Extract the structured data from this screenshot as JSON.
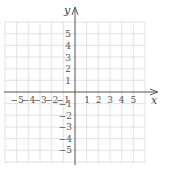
{
  "diagram": {
    "type": "coordinate-plane",
    "x_axis_label": "x",
    "y_axis_label": "y",
    "x_range": [
      -6,
      6
    ],
    "y_range": [
      -6,
      6
    ],
    "x_tick_labels": [
      "−5",
      "−4",
      "−3",
      "−2",
      "−1",
      "1",
      "2",
      "3",
      "4",
      "5"
    ],
    "y_tick_labels": [
      "5",
      "4",
      "3",
      "2",
      "1",
      "−1",
      "−2",
      "−3",
      "−4",
      "−5"
    ],
    "grid": true,
    "colors": {
      "grid": "#e4e4e4",
      "axis": "#555555",
      "text": "#555555"
    }
  }
}
